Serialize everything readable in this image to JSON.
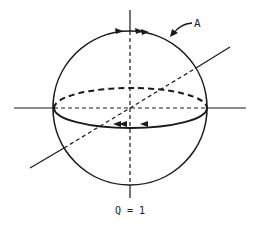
{
  "diagram": {
    "type": "sphere-with-axes",
    "labels": {
      "curve_label": "A",
      "caption": "Q = 1"
    },
    "colors": {
      "stroke": "#1a1a1a",
      "background": "#ffffff"
    },
    "elements": [
      {
        "name": "sphere-outline",
        "kind": "circle"
      },
      {
        "name": "vertical-axis",
        "kind": "line",
        "dashed_inside": true
      },
      {
        "name": "horizontal-axis",
        "kind": "line",
        "dashed_inside": true
      },
      {
        "name": "diagonal-axis",
        "kind": "line",
        "dashed_inside": true
      },
      {
        "name": "equator-front",
        "kind": "arc",
        "style": "solid",
        "arrows": 2
      },
      {
        "name": "equator-back",
        "kind": "arc",
        "style": "dashed"
      },
      {
        "name": "top-arc-arrows",
        "kind": "arrowheads",
        "count": 2
      },
      {
        "name": "label-A-pointer",
        "kind": "arrow"
      }
    ]
  }
}
